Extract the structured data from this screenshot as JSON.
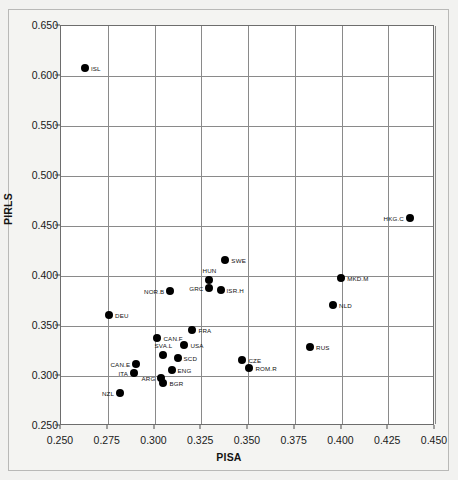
{
  "chart_data": {
    "type": "scatter",
    "title": "",
    "xlabel": "PISA",
    "ylabel": "PIRLS",
    "xlim": [
      0.25,
      0.45
    ],
    "ylim": [
      0.25,
      0.65
    ],
    "xticks": [
      "0.250",
      "0.275",
      "0.300",
      "0.325",
      "0.350",
      "0.375",
      "0.400",
      "0.425",
      "0.450"
    ],
    "yticks": [
      "0.250",
      "0.300",
      "0.350",
      "0.400",
      "0.450",
      "0.500",
      "0.550",
      "0.600",
      "0.650"
    ],
    "grid": true,
    "legend": "none",
    "marker_color": "#000000",
    "points": [
      {
        "label": "ISL",
        "x": 0.2628,
        "y": 0.6085,
        "lpos": "right"
      },
      {
        "label": "HKG.C",
        "x": 0.4366,
        "y": 0.4585,
        "lpos": "left"
      },
      {
        "label": "SWE",
        "x": 0.3379,
        "y": 0.416,
        "lpos": "right"
      },
      {
        "label": "MKD.M",
        "x": 0.3998,
        "y": 0.3985,
        "lpos": "right"
      },
      {
        "label": "HUN",
        "x": 0.3294,
        "y": 0.396,
        "lpos": "above"
      },
      {
        "label": "GRC",
        "x": 0.3294,
        "y": 0.3885,
        "lpos": "left"
      },
      {
        "label": "ISR.H",
        "x": 0.3353,
        "y": 0.386,
        "lpos": "right"
      },
      {
        "label": "NOR.B",
        "x": 0.3085,
        "y": 0.3855,
        "lpos": "left"
      },
      {
        "label": "NLD",
        "x": 0.3955,
        "y": 0.371,
        "lpos": "right"
      },
      {
        "label": "DEU",
        "x": 0.2757,
        "y": 0.361,
        "lpos": "right"
      },
      {
        "label": "FRA",
        "x": 0.3203,
        "y": 0.346,
        "lpos": "right"
      },
      {
        "label": "CAN.F",
        "x": 0.3016,
        "y": 0.3385,
        "lpos": "right"
      },
      {
        "label": "USA",
        "x": 0.316,
        "y": 0.331,
        "lpos": "right"
      },
      {
        "label": "RUS",
        "x": 0.3832,
        "y": 0.329,
        "lpos": "right"
      },
      {
        "label": "SVA.L",
        "x": 0.3048,
        "y": 0.3215,
        "lpos": "above"
      },
      {
        "label": "SCD",
        "x": 0.3123,
        "y": 0.3185,
        "lpos": "right"
      },
      {
        "label": "CZE",
        "x": 0.347,
        "y": 0.316,
        "lpos": "right"
      },
      {
        "label": "CAN.E",
        "x": 0.2902,
        "y": 0.312,
        "lpos": "left"
      },
      {
        "label": "ROM.R",
        "x": 0.3508,
        "y": 0.3085,
        "lpos": "right"
      },
      {
        "label": "ENG",
        "x": 0.3091,
        "y": 0.306,
        "lpos": "right"
      },
      {
        "label": "ITA",
        "x": 0.2891,
        "y": 0.3035,
        "lpos": "left"
      },
      {
        "label": "ARG",
        "x": 0.3037,
        "y": 0.2985,
        "lpos": "left"
      },
      {
        "label": "BGR",
        "x": 0.3048,
        "y": 0.2935,
        "lpos": "right"
      },
      {
        "label": "NZL",
        "x": 0.2816,
        "y": 0.2835,
        "lpos": "left"
      }
    ]
  }
}
